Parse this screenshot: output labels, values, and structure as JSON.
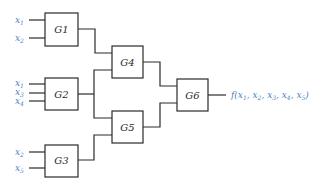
{
  "diagram": {
    "type": "logic-circuit",
    "gates": [
      {
        "id": "G1",
        "label": "G1",
        "inputs": [
          "x1",
          "x2"
        ]
      },
      {
        "id": "G2",
        "label": "G2",
        "inputs": [
          "x1",
          "x3",
          "x4"
        ]
      },
      {
        "id": "G3",
        "label": "G3",
        "inputs": [
          "x2",
          "x5"
        ]
      },
      {
        "id": "G4",
        "label": "G4",
        "inputs": [
          "G1",
          "G2"
        ]
      },
      {
        "id": "G5",
        "label": "G5",
        "inputs": [
          "G2",
          "G3"
        ]
      },
      {
        "id": "G6",
        "label": "G6",
        "inputs": [
          "G4",
          "G5"
        ]
      }
    ],
    "input_labels": {
      "g1_in1": {
        "base": "x",
        "sub": "1"
      },
      "g1_in2": {
        "base": "x",
        "sub": "2"
      },
      "g2_in1": {
        "base": "x",
        "sub": "1"
      },
      "g2_in2": {
        "base": "x",
        "sub": "3"
      },
      "g2_in3": {
        "base": "x",
        "sub": "4"
      },
      "g3_in1": {
        "base": "x",
        "sub": "2"
      },
      "g3_in2": {
        "base": "x",
        "sub": "5"
      }
    },
    "output": {
      "func": "f(",
      "args": [
        {
          "base": "x",
          "sub": "1",
          "sep": ", "
        },
        {
          "base": "x",
          "sub": "2",
          "sep": ", "
        },
        {
          "base": "x",
          "sub": "3",
          "sep": ", "
        },
        {
          "base": "x",
          "sub": "4",
          "sep": ", "
        },
        {
          "base": "x",
          "sub": "5",
          "sep": ")"
        }
      ]
    },
    "colors": {
      "line": "#2a2a2a",
      "variable_text": "#4a7fc0"
    }
  }
}
